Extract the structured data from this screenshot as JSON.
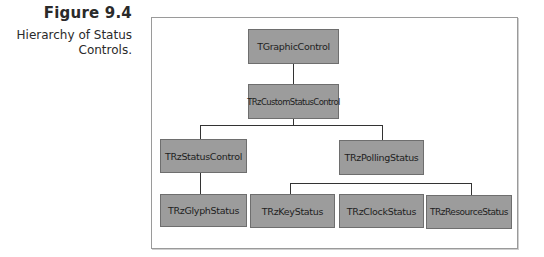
{
  "figure": {
    "number": "Figure 9.4",
    "caption": "Hierarchy of Status Controls."
  },
  "diagram": {
    "type": "class-hierarchy",
    "colors": {
      "node_fill": "#9c9c9c",
      "node_border": "#6e6e6e",
      "line": "#333333",
      "frame": "#9a9a9a"
    },
    "nodes": {
      "tgraphiccontrol": "TGraphicControl",
      "trzcustomstatuscontrol": "TRzCustomStatusControl",
      "trzstatuscontrol": "TRzStatusControl",
      "trzpollingstatus": "TRzPollingStatus",
      "trzglyphstatus": "TRzGlyphStatus",
      "trzkeystatus": "TRzKeyStatus",
      "trzclockstatus": "TRzClockStatus",
      "trzresourcestatus": "TRzResourceStatus"
    },
    "edges": [
      [
        "TGraphicControl",
        "TRzCustomStatusControl"
      ],
      [
        "TRzCustomStatusControl",
        "TRzStatusControl"
      ],
      [
        "TRzCustomStatusControl",
        "TRzPollingStatus"
      ],
      [
        "TRzStatusControl",
        "TRzGlyphStatus"
      ],
      [
        "TRzPollingStatus",
        "TRzKeyStatus"
      ],
      [
        "TRzPollingStatus",
        "TRzClockStatus"
      ],
      [
        "TRzPollingStatus",
        "TRzResourceStatus"
      ]
    ]
  }
}
